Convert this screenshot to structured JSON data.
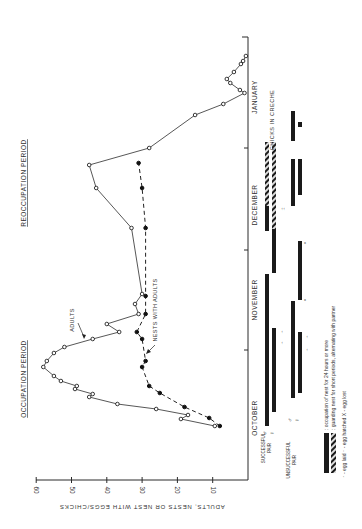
{
  "chart_data": {
    "type": "line",
    "orientation": "rotated-90-ccw",
    "title": "",
    "xlabel": "",
    "ylabel": "ADULTS, NESTS OR NEST WITH EGGS/CHICKS",
    "ylim": [
      0,
      60
    ],
    "yticks": [
      10,
      20,
      30,
      40,
      50,
      60
    ],
    "months": [
      "OCTOBER",
      "NOVEMBER",
      "DECEMBER",
      "JANUARY"
    ],
    "period_labels": [
      "OCCUPATION PERIOD",
      "REOCCUPATION PERIOD"
    ],
    "series": [
      {
        "name": "ADULTS",
        "marker": "open-circle",
        "line": "solid",
        "points": [
          {
            "t": 426,
            "v": 9.4
          },
          {
            "t": 419,
            "v": 19
          },
          {
            "t": 415,
            "v": 17
          },
          {
            "t": 409,
            "v": 26
          },
          {
            "t": 404,
            "v": 37
          },
          {
            "t": 397,
            "v": 45
          },
          {
            "t": 394,
            "v": 44
          },
          {
            "t": 389,
            "v": 49
          },
          {
            "t": 386,
            "v": 48.5
          },
          {
            "t": 381,
            "v": 53
          },
          {
            "t": 376,
            "v": 55
          },
          {
            "t": 367,
            "v": 58
          },
          {
            "t": 361,
            "v": 57
          },
          {
            "t": 353,
            "v": 55
          },
          {
            "t": 347,
            "v": 52
          },
          {
            "t": 339,
            "v": 44
          },
          {
            "t": 332,
            "v": 36.5
          },
          {
            "t": 324,
            "v": 40
          },
          {
            "t": 314,
            "v": 31
          },
          {
            "t": 304,
            "v": 32
          },
          {
            "t": 294,
            "v": 30
          },
          {
            "t": 228,
            "v": 33
          },
          {
            "t": 188,
            "v": 43
          },
          {
            "t": 165,
            "v": 45
          },
          {
            "t": 148,
            "v": 28
          },
          {
            "t": 115,
            "v": 15
          },
          {
            "t": 104,
            "v": 7
          },
          {
            "t": 93,
            "v": 1
          },
          {
            "t": 90,
            "v": 2.3
          },
          {
            "t": 83,
            "v": 5
          },
          {
            "t": 79,
            "v": 6
          },
          {
            "t": 72,
            "v": 4
          },
          {
            "t": 64,
            "v": 2
          },
          {
            "t": 61,
            "v": 1.4
          },
          {
            "t": 56,
            "v": 0.6
          }
        ]
      },
      {
        "name": "NESTS WITH ADULTS",
        "marker": "filled-circle",
        "line": "dashed",
        "points": [
          {
            "t": 426,
            "v": 8
          },
          {
            "t": 418,
            "v": 11
          },
          {
            "t": 407,
            "v": 18
          },
          {
            "t": 393,
            "v": 25
          },
          {
            "t": 386,
            "v": 28
          },
          {
            "t": 367,
            "v": 30
          },
          {
            "t": 361,
            "v": 29
          },
          {
            "t": 339,
            "v": 30
          },
          {
            "t": 332,
            "v": 31.5
          },
          {
            "t": 314,
            "v": 29
          },
          {
            "t": 296,
            "v": 29
          },
          {
            "t": 228,
            "v": 29
          },
          {
            "t": 188,
            "v": 30
          },
          {
            "t": 163,
            "v": 31
          }
        ]
      }
    ],
    "legend": [
      {
        "symbol": "solid-bar",
        "text": ": occupation of nest for 24 hours or more"
      },
      {
        "symbol": "hatched-bar",
        "text": ": guarding nest for short periods, alternating with partner"
      },
      {
        "symbol": "arrows",
        "text": "↑ - egg laid   ↑- egg hatched   X - egg lost"
      }
    ]
  },
  "axis": {
    "label": "ADULTS, NESTS OR NEST WITH EGGS/CHICKS",
    "ticks": [
      "60",
      "50",
      "40",
      "30",
      "20",
      "10"
    ]
  },
  "months": {
    "oct": "OCTOBER",
    "nov": "NOVEMBER",
    "dec": "DECEMBER",
    "jan": "JANUARY"
  },
  "periods": {
    "occupation": "OCCUPATION PERIOD",
    "reoccupation": "REOCCUPATION PERIOD"
  },
  "annotations": {
    "adults": "ADULTS",
    "nests": "NESTS WITH ADULTS",
    "creche": "CHICKS IN CRECHE"
  },
  "pairs": {
    "successful": "SUCCESSFUL",
    "successful_sub": "PAIR",
    "unsuccessful": "UNSUCCESSFUL",
    "unsuccessful_sub": "PAIR",
    "male": "♂",
    "female": "♀"
  },
  "legend": {
    "solid": ": occupation of nest for 24 hours or more",
    "hatched": ": guarding nest for short periods, alternating with partner",
    "symbols": "↑ - egg laid    ↑ - egg hatched    X - egg lost"
  }
}
